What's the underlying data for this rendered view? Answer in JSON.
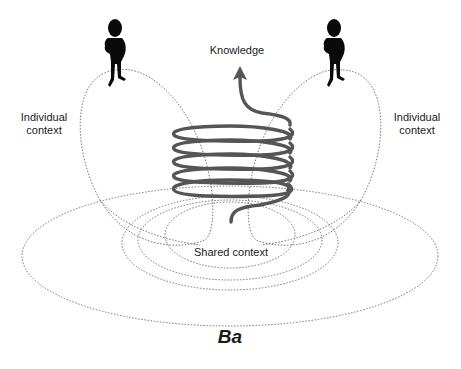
{
  "diagram": {
    "type": "concept-diagram",
    "labels": {
      "knowledge": "Knowledge",
      "individual_context_left_line1": "Individual",
      "individual_context_left_line2": "context",
      "individual_context_right_line1": "Individual",
      "individual_context_right_line2": "context",
      "shared_context": "Shared context",
      "ba": "Ba"
    },
    "elements": {
      "figures": [
        "person-left",
        "person-right"
      ],
      "spiral": {
        "turns": 5,
        "arrow_direction": "up",
        "color": "#555555"
      },
      "contexts": [
        "individual-context-left",
        "individual-context-right",
        "shared-context",
        "ba"
      ]
    },
    "colors": {
      "spiral": "#555555",
      "dotted_lines": "#666666",
      "figure": "#0a0a0a",
      "text": "#1a1a1a"
    }
  }
}
